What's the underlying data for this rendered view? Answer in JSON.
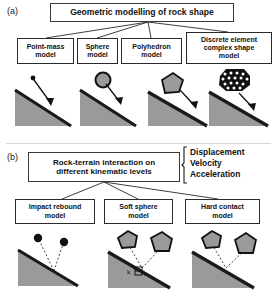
{
  "figure": {
    "width": 277,
    "height": 301,
    "slope_fill": "#9a9a9a",
    "slope_edge": "#1a1a1a",
    "line_color": "#2a2a2a",
    "box_border": "#2a2a2a"
  },
  "panel_a": {
    "label": "(a)",
    "title": "Geometric modelling of rock shape",
    "models": [
      {
        "id": "point-mass",
        "label": "Point-mass model",
        "line1": "Point-mass",
        "line2": "model",
        "icon": "point-mass-icon"
      },
      {
        "id": "sphere",
        "label": "Sphere model",
        "line1": "Sphere",
        "line2": "model",
        "icon": "sphere-icon"
      },
      {
        "id": "polyhedron",
        "label": "Polyhedron model",
        "line1": "Polyhedron",
        "line2": "model",
        "icon": "polyhedron-icon"
      },
      {
        "id": "discrete-element",
        "label": "Discrete element complex shape model",
        "line1": "Discrete element",
        "line2": "complex shape",
        "line3": "model",
        "icon": "discrete-element-clump-icon"
      }
    ]
  },
  "panel_b": {
    "label": "(b)",
    "title_line1": "Rock-terrain interaction on",
    "title_line2": "different kinematic levels",
    "kinematic_levels": [
      "Displacement",
      "Velocity",
      "Acceleration"
    ],
    "models": [
      {
        "id": "impact-rebound",
        "label": "Impact rebound model",
        "line1": "Impact rebound",
        "line2": "model",
        "icon": "impact-rebound-icon"
      },
      {
        "id": "soft-sphere",
        "label": "Soft sphere model",
        "line1": "Soft sphere",
        "line2": "model",
        "icon": "soft-sphere-icon",
        "annotations": [
          "k",
          "c"
        ]
      },
      {
        "id": "hard-contact",
        "label": "Hard contact model",
        "line1": "Hard contact",
        "line2": "model",
        "icon": "hard-contact-icon"
      }
    ]
  }
}
